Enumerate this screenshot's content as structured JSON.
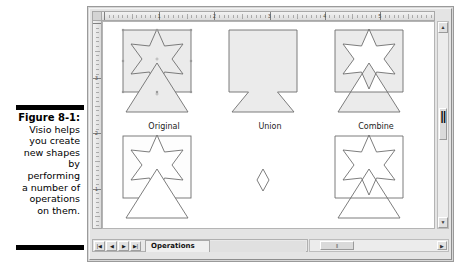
{
  "figure": {
    "label": "Figure 8-1:",
    "caption_lines": [
      "Visio helps",
      "you create",
      "new shapes",
      "by",
      "performing",
      "a number of",
      "operations",
      "on them."
    ]
  },
  "window": {
    "ruler_h_numbers": [
      "1",
      "2",
      "3",
      "4",
      "5"
    ],
    "ruler_v_numbers": [
      "3",
      "2",
      "1"
    ]
  },
  "canvas": {
    "cells": [
      {
        "label": "Original",
        "shape": "original"
      },
      {
        "label": "Union",
        "shape": "union"
      },
      {
        "label": "Combine",
        "shape": "combine"
      },
      {
        "label": "Fragment",
        "shape": "fragment"
      },
      {
        "label": "Intersect",
        "shape": "intersect"
      },
      {
        "label": "Subtract",
        "shape": "subtract"
      }
    ],
    "shape_fill": "#ebebeb",
    "shape_stroke": "#6e6e6e"
  },
  "statusbar": {
    "nav_first": "|◀",
    "nav_prev": "◀",
    "nav_next": "▶",
    "nav_last": "▶|",
    "page_tab": "Operations"
  },
  "scrollbars": {
    "v_up": "▲",
    "v_down": "▼",
    "h_right": "▶",
    "h_thumb": "‖",
    "v_thumb": "‖"
  }
}
